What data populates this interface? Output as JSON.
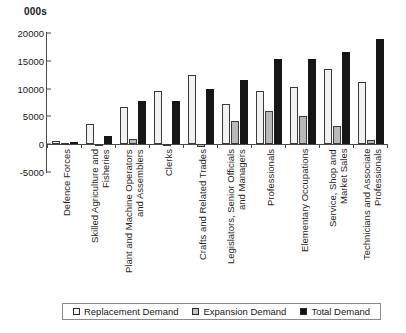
{
  "chart": {
    "axis_title": "000s",
    "y_ticks": [
      "20000",
      "15000",
      "10000",
      "5000",
      "0",
      "-5000"
    ]
  },
  "legend": {
    "items": [
      {
        "label": "Replacement Demand",
        "color": "#f7f7f7"
      },
      {
        "label": "Expansion Demand",
        "color": "#c2c2c2"
      },
      {
        "label": "Total Demand",
        "color": "#111111"
      }
    ]
  },
  "categories_display": [
    "Defence Forces",
    "Skilled Agriculture and\nFisheries",
    "Plant and Machine Operators\nand Assemblers",
    "Clerks",
    "Crafts and Related Trades",
    "Legislators, Senior Officials\nand Managers",
    "Professionals",
    "Elementary Occupations",
    "Service, Shop and\nMarket Sales",
    "Technicians and Associate\nProfessionals"
  ],
  "chart_data": {
    "type": "bar",
    "title": "",
    "xlabel": "",
    "ylabel": "000s",
    "ylim": [
      -5000,
      20000
    ],
    "ytick_step": 5000,
    "grid": false,
    "legend_position": "bottom",
    "categories": [
      "Defence Forces",
      "Skilled Agriculture and Fisheries",
      "Plant and Machine Operators and Assemblers",
      "Clerks",
      "Crafts and Related Trades",
      "Legislators, Senior Officials and Managers",
      "Professionals",
      "Elementary Occupations",
      "Service, Shop and Market Sales",
      "Technicians and Associate Professionals"
    ],
    "series": [
      {
        "name": "Replacement Demand",
        "color": "#f7f7f7",
        "values": [
          500,
          3700,
          6750,
          9650,
          12450,
          7250,
          9500,
          10300,
          13450,
          11250
        ]
      },
      {
        "name": "Expansion Demand",
        "color": "#c2c2c2",
        "values": [
          -200,
          -350,
          900,
          -400,
          -450,
          4250,
          5900,
          5150,
          3200,
          700
        ]
      },
      {
        "name": "Total Demand",
        "color": "#111111",
        "values": [
          350,
          1450,
          7700,
          7750,
          10000,
          11550,
          15400,
          15350,
          16600,
          18850
        ]
      }
    ]
  }
}
